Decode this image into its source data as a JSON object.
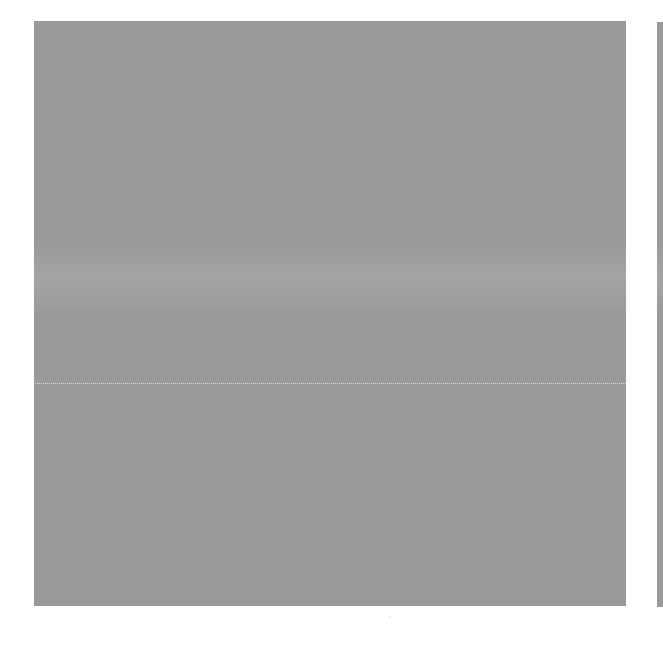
{
  "page": {
    "background": "#ffffff",
    "width": 663,
    "height": 660
  },
  "panels": [
    {
      "id": "left",
      "description": "halftone gray panel",
      "color": "#c4c4c4",
      "x": 34,
      "y": 21,
      "width": 592,
      "height": 585
    },
    {
      "id": "right",
      "description": "halftone gray panel (cropped at right edge)",
      "color": "#c4c4c4",
      "x": 657,
      "y": 22,
      "width": 6,
      "height": 585
    }
  ],
  "artifacts": {
    "horizontal_scanline_y": 383,
    "speck": {
      "x": 390,
      "y": 617
    }
  }
}
